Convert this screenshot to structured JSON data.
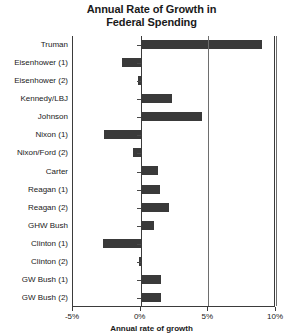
{
  "chart_data": {
    "type": "bar",
    "orientation": "horizontal",
    "title": "Annual Rate of Growth in Federal Spending",
    "title_line1": "Annual Rate of Growth in",
    "title_line2": "Federal Spending",
    "xlabel": "Annual rate of growth",
    "ylabel": "",
    "xlim": [
      -5,
      10
    ],
    "xticks": [
      -5,
      0,
      5,
      10
    ],
    "xtick_labels": [
      "-5%",
      "0%",
      "5%",
      "10%"
    ],
    "grid": "vertical gridlines at 5% and 10%",
    "legend": "none",
    "bar_color": "#3a3a3a",
    "categories": [
      "Truman",
      "Eisenhower (1)",
      "Eisenhower (2)",
      "Kennedy/LBJ",
      "Johnson",
      "Nixon (1)",
      "Nixon/Ford (2)",
      "Carter",
      "Reagan (1)",
      "Reagan (2)",
      "GHW Bush",
      "Clinton (1)",
      "Clinton (2)",
      "GW Bush (1)",
      "GW Bush (2)"
    ],
    "values": [
      9.0,
      -1.4,
      -0.2,
      2.3,
      4.5,
      -2.7,
      -0.6,
      1.3,
      1.4,
      2.1,
      1.0,
      -2.8,
      -0.1,
      1.5,
      1.5
    ]
  }
}
